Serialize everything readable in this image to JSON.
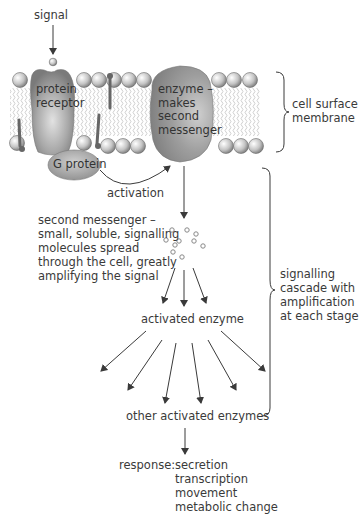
{
  "diagram": {
    "labels": {
      "signal": "signal",
      "protein_receptor": [
        "protein",
        "receptor"
      ],
      "enzyme": [
        "enzyme –",
        "makes",
        "second",
        "messenger"
      ],
      "g_protein": "G protein",
      "activation": "activation",
      "cell_surface_membrane": [
        "cell surface",
        "membrane"
      ],
      "second_messenger": [
        "second messenger –",
        "small, soluble, signalling",
        "molecules spread",
        "through the cell, greatly",
        "amplifying the signal"
      ],
      "signalling_cascade": [
        "signalling",
        "cascade with",
        "amplification",
        "at each stage"
      ],
      "activated_enzyme": "activated enzyme",
      "other_activated_enzymes": "other activated enzymes",
      "response_label": "response:",
      "responses": [
        "secretion",
        "transcription",
        "movement",
        "metabolic change"
      ]
    },
    "colors": {
      "protein_fill": "#8a8a8a",
      "protein_highlight": "#d0d0d0",
      "lipid_head": "#bdbdbd",
      "lipid_tail": "#c8c8c8",
      "anchor": "#6a6a6a",
      "arrow": "#3a3a3a",
      "text": "#3a3a3a"
    }
  }
}
